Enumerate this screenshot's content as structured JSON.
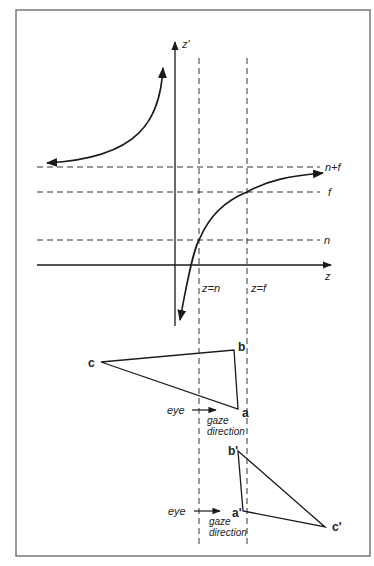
{
  "diagram": {
    "type": "perspective-depth-mapping",
    "axes": {
      "vertical_label": "z'",
      "horizontal_label": "z"
    },
    "horizontal_asymptotes": [
      {
        "label": "n+f"
      },
      {
        "label": "f"
      },
      {
        "label": "n"
      }
    ],
    "vertical_guides": [
      {
        "label": "z=n"
      },
      {
        "label": "z=f"
      }
    ],
    "original_triangle": {
      "vertices": [
        {
          "label": "a"
        },
        {
          "label": "b"
        },
        {
          "label": "c"
        }
      ],
      "eye_label": "eye",
      "gaze_label_1": "gaze",
      "gaze_label_2": "direction"
    },
    "transformed_triangle": {
      "vertices": [
        {
          "label": "a'"
        },
        {
          "label": "b'"
        },
        {
          "label": "c'"
        }
      ],
      "eye_label": "eye",
      "gaze_label_1": "gaze",
      "gaze_label_2": "direction"
    }
  },
  "colors": {
    "frame": "#777777",
    "stroke": "#1a1a1a",
    "dash": "#333333"
  }
}
